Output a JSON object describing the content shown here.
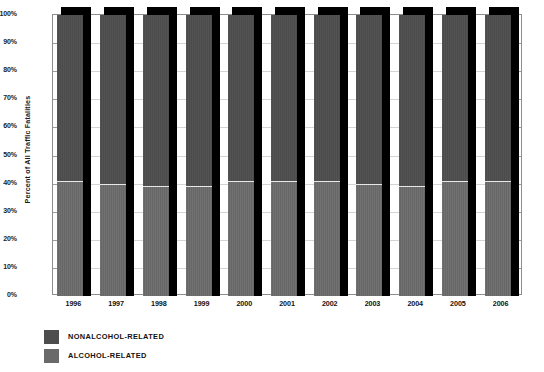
{
  "chart_data": {
    "type": "bar",
    "subtype": "stacked-100-percent",
    "title": "",
    "xlabel": "",
    "ylabel": "Percent of All Traffic Fatalities",
    "ylim": [
      0,
      100
    ],
    "yticks": [
      "0%",
      "10%",
      "20%",
      "30%",
      "40%",
      "50%",
      "60%",
      "70%",
      "80%",
      "90%",
      "100%"
    ],
    "ytick_values": [
      0,
      10,
      20,
      30,
      40,
      50,
      60,
      70,
      80,
      90,
      100
    ],
    "grid": true,
    "legend_position": "below-left",
    "categories": [
      "1996",
      "1997",
      "1998",
      "1999",
      "2000",
      "2001",
      "2002",
      "2003",
      "2004",
      "2005",
      "2006"
    ],
    "series": [
      {
        "name": "NONALCOHOL-RELATED",
        "color": "#4d4d4d",
        "values": [
          59,
          60,
          61,
          61,
          59,
          59,
          59,
          60,
          61,
          59,
          59
        ]
      },
      {
        "name": "ALCOHOL-RELATED",
        "color": "#6a6a6a",
        "values": [
          41,
          40,
          39,
          39,
          41,
          41,
          41,
          40,
          39,
          41,
          41
        ]
      }
    ]
  },
  "legend": {
    "items": [
      {
        "label": "NONALCOHOL-RELATED",
        "color": "#4d4d4d"
      },
      {
        "label": "ALCOHOL-RELATED",
        "color": "#6a6a6a"
      }
    ]
  },
  "colors": {
    "shadow": "#000000",
    "frame": "#8d8d8d",
    "grid": "#d4d4d4",
    "background": "#ffffff",
    "text": "#111111"
  }
}
